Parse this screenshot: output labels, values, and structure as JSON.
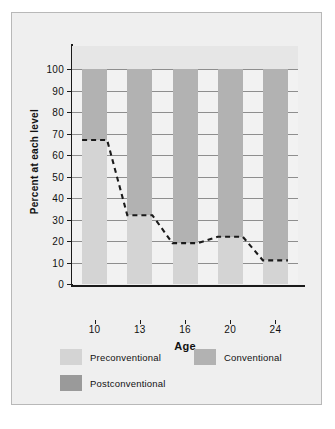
{
  "chart_data": {
    "type": "bar",
    "subtype": "stacked-bar",
    "title": "",
    "xlabel": "Age",
    "ylabel": "Percent at each level",
    "categories": [
      "10",
      "13",
      "16",
      "20",
      "24"
    ],
    "ylim": [
      0,
      100
    ],
    "yticks": [
      0,
      10,
      20,
      30,
      40,
      50,
      60,
      70,
      80,
      90,
      100
    ],
    "ytick_labels": [
      "0",
      "10",
      "20",
      "30",
      "40",
      "50",
      "60",
      "70",
      "80",
      "90",
      "100"
    ],
    "grid": true,
    "legend_position": "bottom",
    "series": [
      {
        "name": "Preconventional",
        "color": "#d4d4d4",
        "values": [
          67,
          32,
          19,
          22,
          11
        ]
      },
      {
        "name": "Conventional",
        "color": "#b2b2b2",
        "values": [
          33,
          68,
          81,
          78,
          89
        ]
      },
      {
        "name": "Postconventional",
        "color": "#9a9a9a",
        "values": [
          0,
          0,
          0,
          0,
          0
        ]
      }
    ],
    "annotations": [
      {
        "type": "dashed-line",
        "name": "preconventional-boundary-trend",
        "description": "Dashed trend line tracing the top of the Preconventional segment across ages",
        "points": [
          {
            "x": "10",
            "y": 67
          },
          {
            "x": "13",
            "y": 32
          },
          {
            "x": "16",
            "y": 19
          },
          {
            "x": "20",
            "y": 22
          },
          {
            "x": "24",
            "y": 11
          }
        ]
      }
    ]
  },
  "axes": {
    "y_title": "Percent at each level",
    "x_title": "Age",
    "y_tick_labels": [
      "100",
      "90",
      "80",
      "70",
      "60",
      "50",
      "40",
      "30",
      "20",
      "10",
      "0"
    ],
    "x_tick_labels": [
      "10",
      "13",
      "16",
      "20",
      "24"
    ]
  },
  "legend": {
    "items": [
      {
        "label": "Preconventional",
        "color": "#d4d4d4"
      },
      {
        "label": "Conventional",
        "color": "#b2b2b2"
      },
      {
        "label": "Postconventional",
        "color": "#9a9a9a"
      }
    ]
  },
  "colors": {
    "panel_background": "#efefef",
    "plot_background": "#f2f2f2",
    "plot_top_band": "#e6e6e6",
    "frame_border": "#b8b8b8",
    "axis": "#1a1a1a",
    "gridline": "#8e8e8e",
    "trend_line": "#1a1a1a"
  }
}
